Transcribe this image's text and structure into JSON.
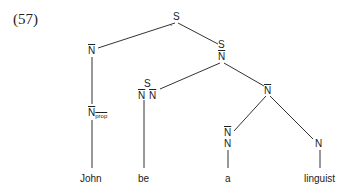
{
  "example_number": "(57)",
  "nodes": {
    "root": "S",
    "root_mark": "˙",
    "subject_nbar": "N",
    "pred_num": "S",
    "pred_den": "N",
    "be_num": "S",
    "be_den_left": "N",
    "be_den_right": "N",
    "object_nbar": "N",
    "det_num": "N",
    "det_den": "N",
    "noun": "N",
    "nprop_base": "N",
    "nprop_sub": "prop"
  },
  "words": [
    "John",
    "be",
    "a",
    "linguist"
  ]
}
